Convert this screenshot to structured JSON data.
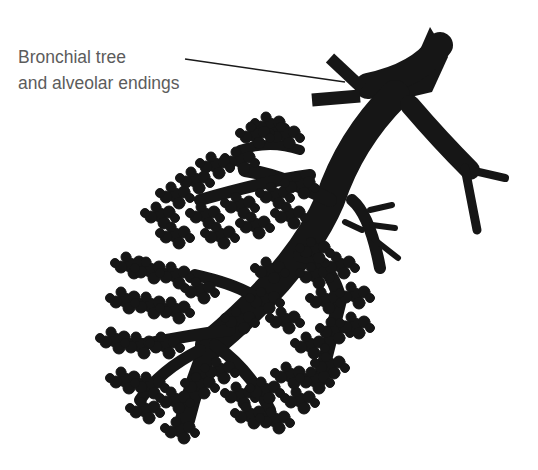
{
  "diagram": {
    "label": {
      "line1": "Bronchial tree",
      "line2": "and alveolar endings"
    },
    "colors": {
      "background": "#ffffff",
      "silhouette": "#161616",
      "label_text": "#5c5c5c",
      "leader_line": "#1a1a1a"
    }
  }
}
